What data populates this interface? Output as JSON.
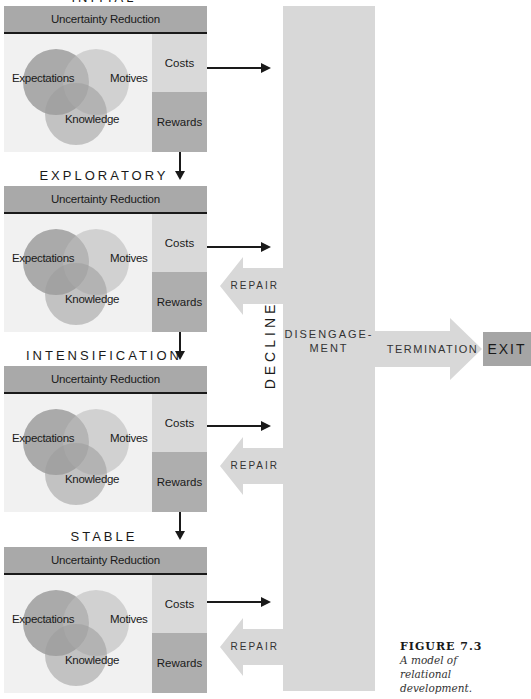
{
  "stages": [
    {
      "label": "INITIAL",
      "header": "Uncertainty Reduction",
      "venn": [
        "Expectations",
        "Motives",
        "Knowledge"
      ],
      "costs": "Costs",
      "rewards": "Rewards"
    },
    {
      "label": "EXPLORATORY",
      "header": "Uncertainty Reduction",
      "venn": [
        "Expectations",
        "Motives",
        "Knowledge"
      ],
      "costs": "Costs",
      "rewards": "Rewards"
    },
    {
      "label": "INTENSIFICATION",
      "header": "Uncertainty Reduction",
      "venn": [
        "Expectations",
        "Motives",
        "Knowledge"
      ],
      "costs": "Costs",
      "rewards": "Rewards"
    },
    {
      "label": "STABLE",
      "header": "Uncertainty Reduction",
      "venn": [
        "Expectations",
        "Motives",
        "Knowledge"
      ],
      "costs": "Costs",
      "rewards": "Rewards"
    }
  ],
  "decline": {
    "label": "DECLINE",
    "disengagement_line1": "DISENGAGE-",
    "disengagement_line2": "MENT",
    "repair_labels": [
      "REPAIR",
      "REPAIR",
      "REPAIR"
    ]
  },
  "termination": {
    "label": "TERMINATION",
    "exit": "EXIT"
  },
  "caption": {
    "number": "FIGURE 7.3",
    "line1": "A model of",
    "line2": "relational",
    "line3": "development."
  },
  "colors": {
    "header_bg": "#a9a9a9",
    "panel_bg": "#f1f1f1",
    "costs_bg": "#d9d9d9",
    "rewards_bg": "#aeaeae",
    "decline_bg": "#d8d8d8",
    "exit_bg": "#a5a5a5"
  }
}
